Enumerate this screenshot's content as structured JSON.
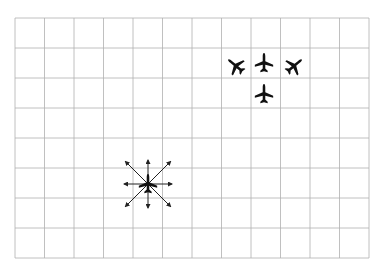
{
  "diagram": {
    "title": "",
    "grid": {
      "columns": 12,
      "rows": 8,
      "left": 15,
      "top": 18,
      "right": 369,
      "bottom": 258,
      "line_color": "#b0b0b0"
    },
    "aircraft": [
      {
        "id": "plane-top-center",
        "x": 264,
        "y": 63,
        "rotation": 0
      },
      {
        "id": "plane-left-tilted",
        "x": 236,
        "y": 66,
        "rotation": -50
      },
      {
        "id": "plane-right-tilted",
        "x": 294,
        "y": 66,
        "rotation": 50
      },
      {
        "id": "plane-below-center",
        "x": 264,
        "y": 94,
        "rotation": 0
      },
      {
        "id": "plane-with-arrows",
        "x": 148,
        "y": 184,
        "rotation": 0
      }
    ],
    "arrow_burst": {
      "center_x": 148,
      "center_y": 184,
      "directions": 8,
      "length_axis": 24,
      "length_diag": 32,
      "color": "#222222"
    },
    "plane_color": "#111111"
  }
}
